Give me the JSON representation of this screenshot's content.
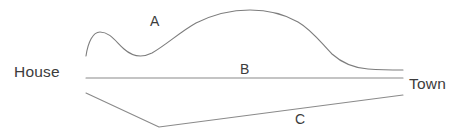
{
  "diagram": {
    "nodes": [
      {
        "id": "house",
        "label": "House"
      },
      {
        "id": "town",
        "label": "Town"
      }
    ],
    "routes": [
      {
        "id": "a",
        "label": "A",
        "shape": "wavy-hill-curve",
        "stroke": "#7d7d7d",
        "path": "M 86 56 C 88 42, 93 32, 100 32 C 110 32, 116 42, 124 49 C 133 57, 142 58, 152 53 C 166 45, 180 32, 196 23 C 214 14, 232 10, 250 10 C 268 10, 284 14, 298 22 C 312 30, 322 44, 332 54 C 342 63, 354 68, 368 69 C 382 70, 394 70, 403 70"
      },
      {
        "id": "b",
        "label": "B",
        "shape": "straight-line",
        "stroke": "#8a8a8a",
        "path": "M 86 78 L 403 78"
      },
      {
        "id": "c",
        "label": "C",
        "shape": "v-shaped-line",
        "stroke": "#8a8a8a",
        "path": "M 86 93 L 159 127 L 403 95"
      }
    ],
    "colors": {
      "background": "#ffffff",
      "stroke": "#8a8a8a",
      "text": "#3c3c3c"
    }
  }
}
